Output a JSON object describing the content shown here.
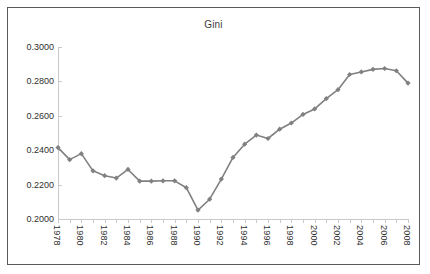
{
  "chart_data": {
    "type": "line",
    "title": "Gini",
    "xlabel": "",
    "ylabel": "",
    "grid": false,
    "legend": false,
    "legend_position": "none",
    "marker": "diamond",
    "series_color": "#808080",
    "axis_color": "#c9c9c9",
    "text_color": "#2f2f2f",
    "xlim": [
      1978,
      2008
    ],
    "ylim": [
      0.2,
      0.3
    ],
    "ytick_step": 0.02,
    "ytick_labels": [
      "0.2000",
      "0.2200",
      "0.2400",
      "0.2600",
      "0.2800",
      "0.3000"
    ],
    "ytick_values": [
      0.2,
      0.22,
      0.24,
      0.26,
      0.28,
      0.3
    ],
    "xtick_labels": [
      "1978",
      "1980",
      "1982",
      "1984",
      "1986",
      "1988",
      "1990",
      "1992",
      "1994",
      "1996",
      "1998",
      "2000",
      "2002",
      "2004",
      "2006",
      "2008"
    ],
    "xtick_label_step": 2,
    "x": [
      1978,
      1979,
      1980,
      1981,
      1982,
      1983,
      1984,
      1985,
      1986,
      1987,
      1988,
      1989,
      1990,
      1991,
      1992,
      1993,
      1994,
      1995,
      1996,
      1997,
      1998,
      1999,
      2000,
      2001,
      2002,
      2003,
      2004,
      2005,
      2006,
      2007,
      2008
    ],
    "categories": [
      "1978",
      "1979",
      "1980",
      "1981",
      "1982",
      "1983",
      "1984",
      "1985",
      "1986",
      "1987",
      "1988",
      "1989",
      "1990",
      "1991",
      "1992",
      "1993",
      "1994",
      "1995",
      "1996",
      "1997",
      "1998",
      "1999",
      "2000",
      "2001",
      "2002",
      "2003",
      "2004",
      "2005",
      "2006",
      "2007",
      "2008"
    ],
    "values": [
      0.2415,
      0.2345,
      0.238,
      0.228,
      0.2252,
      0.2238,
      0.2288,
      0.222,
      0.222,
      0.2222,
      0.2222,
      0.2182,
      0.2052,
      0.2115,
      0.2232,
      0.2358,
      0.2435,
      0.2488,
      0.2468,
      0.2522,
      0.2558,
      0.2608,
      0.264,
      0.27,
      0.2752,
      0.284,
      0.2855,
      0.287,
      0.2875,
      0.2862,
      0.279
    ],
    "series": [
      {
        "name": "Gini",
        "values": [
          0.2415,
          0.2345,
          0.238,
          0.228,
          0.2252,
          0.2238,
          0.2288,
          0.222,
          0.222,
          0.2222,
          0.2222,
          0.2182,
          0.2052,
          0.2115,
          0.2232,
          0.2358,
          0.2435,
          0.2488,
          0.2468,
          0.2522,
          0.2558,
          0.2608,
          0.264,
          0.27,
          0.2752,
          0.284,
          0.2855,
          0.287,
          0.2875,
          0.2862,
          0.279
        ]
      }
    ]
  }
}
